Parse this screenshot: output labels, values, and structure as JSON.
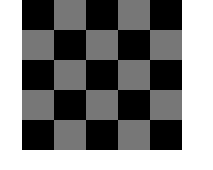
{
  "board": {
    "rows": 5,
    "cols": 5,
    "dark_color": "#000000",
    "light_color": "#777777",
    "top_left": "dark",
    "cells": [
      [
        "dark",
        "light",
        "dark",
        "light",
        "dark"
      ],
      [
        "light",
        "dark",
        "light",
        "dark",
        "light"
      ],
      [
        "dark",
        "light",
        "dark",
        "light",
        "dark"
      ],
      [
        "light",
        "dark",
        "light",
        "dark",
        "light"
      ],
      [
        "dark",
        "light",
        "dark",
        "light",
        "dark"
      ]
    ]
  }
}
